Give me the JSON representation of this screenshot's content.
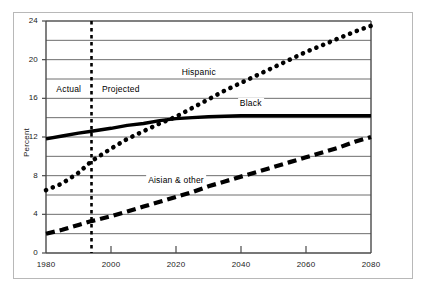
{
  "chart_data": {
    "type": "line",
    "title": "",
    "subtitle": "",
    "xlabel": "",
    "ylabel": "Percent",
    "xlim": [
      1980,
      2080
    ],
    "ylim": [
      0,
      24
    ],
    "grid": true,
    "grid_minor_step": 2,
    "legend_position": "inline-labels",
    "x_ticks": [
      1980,
      2000,
      2020,
      2040,
      2060,
      2080
    ],
    "x_tick_labels": [
      "1980",
      "2000",
      "2020",
      "2040",
      "2060",
      "2080"
    ],
    "y_ticks": [
      0,
      4,
      8,
      12,
      16,
      20,
      24
    ],
    "y_tick_labels": [
      "0",
      "4",
      "8",
      "12",
      "16",
      "20",
      "24"
    ],
    "y_gridlines": [
      0,
      2,
      4,
      6,
      8,
      10,
      12,
      14,
      16,
      18,
      20,
      22,
      24
    ],
    "annotations": [
      {
        "name": "actual-region-label",
        "text": "Actual",
        "x": 1987,
        "y": 16.9
      },
      {
        "name": "projected-region-label",
        "text": "Projected",
        "x": 2003,
        "y": 16.9
      }
    ],
    "divider": {
      "name": "actual-projected-divider",
      "label": "",
      "x": 1994,
      "style": "dotted-vertical",
      "color": "#000000"
    },
    "series": [
      {
        "name": "Hispanic",
        "style": "dotted",
        "color": "#000000",
        "label_x": 2027,
        "label_y": 18.6,
        "x": [
          1980,
          1985,
          1990,
          1994,
          2000,
          2005,
          2010,
          2015,
          2020,
          2025,
          2030,
          2035,
          2040,
          2045,
          2050,
          2055,
          2060,
          2065,
          2070,
          2075,
          2080
        ],
        "values": [
          6.5,
          7.2,
          8.3,
          9.5,
          10.8,
          11.8,
          12.6,
          13.4,
          14.1,
          15.0,
          15.9,
          16.8,
          17.6,
          18.4,
          19.2,
          20.0,
          20.8,
          21.5,
          22.2,
          22.9,
          23.5
        ]
      },
      {
        "name": "Black",
        "style": "solid",
        "color": "#000000",
        "label_x": 2043,
        "label_y": 15.4,
        "x": [
          1980,
          1985,
          1990,
          1994,
          2000,
          2005,
          2010,
          2015,
          2020,
          2025,
          2030,
          2035,
          2040,
          2045,
          2050,
          2055,
          2060,
          2065,
          2070,
          2075,
          2080
        ],
        "values": [
          11.8,
          12.1,
          12.4,
          12.6,
          12.9,
          13.2,
          13.4,
          13.7,
          13.9,
          14.0,
          14.1,
          14.15,
          14.2,
          14.2,
          14.2,
          14.2,
          14.2,
          14.2,
          14.2,
          14.2,
          14.2
        ]
      },
      {
        "name": "Aisian & other",
        "style": "dashed",
        "color": "#000000",
        "label_x": 2020,
        "label_y": 7.4,
        "x": [
          1980,
          1985,
          1990,
          1994,
          2000,
          2005,
          2010,
          2015,
          2020,
          2025,
          2030,
          2035,
          2040,
          2045,
          2050,
          2055,
          2060,
          2065,
          2070,
          2075,
          2080
        ],
        "values": [
          2.0,
          2.4,
          2.9,
          3.3,
          3.8,
          4.3,
          4.8,
          5.3,
          5.8,
          6.3,
          6.9,
          7.4,
          7.9,
          8.4,
          8.9,
          9.4,
          9.9,
          10.4,
          10.9,
          11.5,
          12.0
        ]
      }
    ]
  },
  "axes": {
    "y_title": "Percent"
  },
  "colors": {
    "ink": "#000000",
    "gridline": "#6e6e6e",
    "axis": "#4a4a4a",
    "outer_frame": "#b8b8b8",
    "background": "#ffffff"
  }
}
